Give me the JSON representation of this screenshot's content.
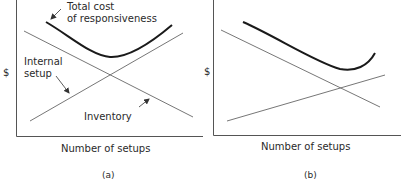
{
  "panels": [
    {
      "id": "a",
      "caption": "(a)",
      "y_axis_label": "$",
      "x_axis_label": "Number of setups",
      "curves": {
        "total_cost": {
          "label_line1": "Total cost",
          "label_line2": "of responsiveness"
        },
        "internal_setup": {
          "label_line1": "Internal",
          "label_line2": "setup"
        },
        "inventory": {
          "label": "Inventory"
        }
      }
    },
    {
      "id": "b",
      "caption": "(b)",
      "y_axis_label": "$",
      "x_axis_label": "Number of setups"
    }
  ],
  "colors": {
    "axis": "#555555",
    "thin_line": "#666666",
    "total_cost_curve": "#1a1a1a",
    "text": "#2a2a2a"
  }
}
